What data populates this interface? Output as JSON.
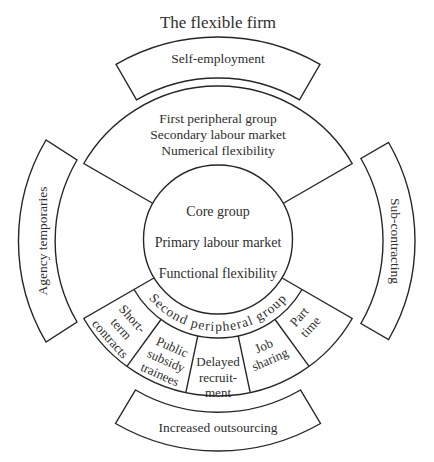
{
  "diagram": {
    "title": "The flexible firm",
    "outer_bands": {
      "top": "Self-employment",
      "left": "Agency temporaries",
      "right": "Sub-contracting",
      "bottom": "Increased outsourcing"
    },
    "first_peripheral": {
      "lines": [
        "First peripheral group",
        "Secondary labour market",
        "Numerical flexibility"
      ]
    },
    "core": {
      "lines": [
        "Core group",
        "Primary labour market",
        "Functional flexibility"
      ]
    },
    "second_peripheral": {
      "label": "Second peripheral group",
      "segments": [
        {
          "name": "short-term-contracts",
          "lines": [
            "Short-",
            "term",
            "contracts"
          ]
        },
        {
          "name": "public-subsidy-trainees",
          "lines": [
            "Public",
            "subsidy",
            "trainees"
          ]
        },
        {
          "name": "delayed-recruitment",
          "lines": [
            "Delayed",
            "recruit-",
            "ment"
          ]
        },
        {
          "name": "job-sharing",
          "lines": [
            "Job",
            "sharing"
          ]
        },
        {
          "name": "part-time",
          "lines": [
            "Part",
            "time"
          ]
        }
      ]
    }
  },
  "colors": {
    "stroke": "#262626",
    "text": "#2e2e2e",
    "background": "#ffffff"
  }
}
